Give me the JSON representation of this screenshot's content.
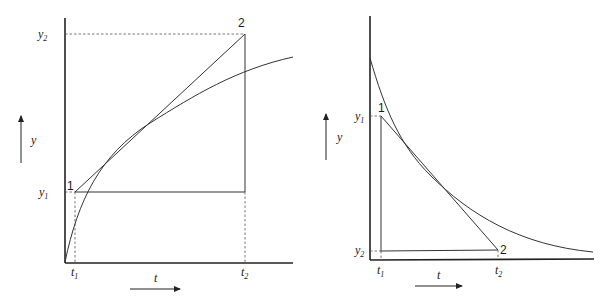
{
  "figure": {
    "panels": [
      {
        "id": "increasing",
        "description": "Chord vs tangent on increasing concave curve",
        "axis_labels": {
          "y": "y",
          "x": "t"
        },
        "points": [
          {
            "label": "1",
            "t": "t",
            "t_sub": "1",
            "y": "y",
            "y_sub": "1"
          },
          {
            "label": "2",
            "t": "t",
            "t_sub": "2",
            "y": "y",
            "y_sub": "2"
          }
        ]
      },
      {
        "id": "decreasing",
        "description": "Chord vs tangent on decreasing convex curve",
        "axis_labels": {
          "y": "y",
          "x": "t"
        },
        "points": [
          {
            "label": "1",
            "t": "t",
            "t_sub": "1",
            "y": "y",
            "y_sub": "1"
          },
          {
            "label": "2",
            "t": "t",
            "t_sub": "2",
            "y": "y",
            "y_sub": "2"
          }
        ]
      }
    ],
    "colors": {
      "ink": "#222222",
      "background": "#ffffff"
    }
  }
}
